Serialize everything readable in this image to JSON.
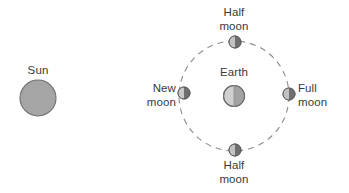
{
  "diagram": {
    "background_color": "#ffffff",
    "labels": {
      "sun": "Sun",
      "earth": "Earth",
      "new_moon": "New\nmoon",
      "new_moon_line1": "New",
      "new_moon_line2": "moon",
      "full_moon_line1": "Full",
      "full_moon_line2": "moon",
      "half_moon_top_line1": "Half",
      "half_moon_top_line2": "moon",
      "half_moon_bottom_line1": "Half",
      "half_moon_bottom_line2": "moon"
    },
    "colors": {
      "body_fill": "#9e9e9e",
      "body_fill_light": "#c9c9c9",
      "body_fill_dark": "#8a8a8a",
      "outline": "#6d6d6d",
      "orbit_stroke": "#8c8c8c",
      "text": "#3a3a3a",
      "background": "#ffffff"
    },
    "geometry": {
      "sun": {
        "cx": 38,
        "cy": 98,
        "r": 18
      },
      "earth": {
        "cx": 234,
        "cy": 96,
        "r": 10.5,
        "lit_side": "left"
      },
      "orbit": {
        "cx": 234,
        "cy": 96,
        "r": 55,
        "style": "dashed",
        "dash": "6 5"
      },
      "moons": [
        {
          "name": "new-moon",
          "cx": 184,
          "cy": 93,
          "r": 6,
          "phase": "new",
          "lit_side": "left"
        },
        {
          "name": "half-moon-top",
          "cx": 235,
          "cy": 42,
          "r": 6,
          "phase": "half",
          "lit_side": "left"
        },
        {
          "name": "full-moon",
          "cx": 289,
          "cy": 94,
          "r": 6,
          "phase": "full",
          "lit_side": "left"
        },
        {
          "name": "half-moon-bottom",
          "cx": 235,
          "cy": 150,
          "r": 6,
          "phase": "half",
          "lit_side": "left"
        }
      ]
    }
  }
}
